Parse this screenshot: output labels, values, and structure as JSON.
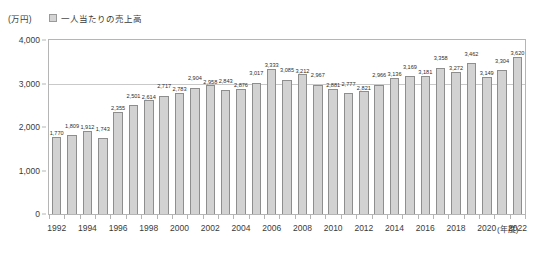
{
  "unit_label": "(万円)",
  "legend": {
    "label": "一人当たりの売上高",
    "swatch_color": "#d2d2d2",
    "swatch_border": "#8e8e8e",
    "position": "top-left"
  },
  "x_axis_caption": "(年度)",
  "colors": {
    "bar_fill": "#d2d2d2",
    "bar_border": "#8e8e8e",
    "frame": "#b5b5b5",
    "grid": "#c9c9c9",
    "text": "#333333"
  },
  "chart_data": {
    "type": "bar",
    "title": "",
    "subtitle": "",
    "xlabel": "(年度)",
    "ylabel": "(万円)",
    "ylim": [
      0,
      4000
    ],
    "y_ticks": [
      "0",
      "1,000",
      "2,000",
      "3,000",
      "4,000"
    ],
    "y_tick_values": [
      0,
      1000,
      2000,
      3000,
      4000
    ],
    "grid": "horizontal-at-3000",
    "legend": [
      "一人当たりの売上高"
    ],
    "x_tick_label_interval": 2,
    "categories": [
      "1992",
      "1993",
      "1994",
      "1995",
      "1996",
      "1997",
      "1998",
      "1999",
      "2000",
      "2001",
      "2002",
      "2003",
      "2004",
      "2005",
      "2006",
      "2007",
      "2008",
      "2009",
      "2010",
      "2011",
      "2012",
      "2013",
      "2014",
      "2015",
      "2016",
      "2017",
      "2018",
      "2019",
      "2020",
      "2021",
      "2022"
    ],
    "values": [
      1770,
      1809,
      1912,
      1743,
      2355,
      2501,
      2614,
      2717,
      2783,
      2904,
      2958,
      2843,
      2876,
      3017,
      3333,
      3085,
      3212,
      2967,
      2881,
      2777,
      2821,
      2966,
      3136,
      3169,
      3181,
      3358,
      3272,
      3462,
      3149,
      3304,
      3620
    ],
    "data_labels": [
      "1,770",
      "1,809",
      "1,912",
      "1,743",
      "2,355",
      "2,501",
      "2,614",
      "2,717",
      "2,783",
      "2,904",
      "2,958",
      "2,843",
      "2,876",
      "3,017",
      "3,333",
      "3,085",
      "3,212",
      "2,967",
      "2,881",
      "2,777",
      "2,821",
      "2,966",
      "3,136",
      "3,169",
      "3,181",
      "3,358",
      "3,272",
      "3,462",
      "3,149",
      "3,304",
      "3,620"
    ],
    "series": [
      {
        "name": "一人当たりの売上高",
        "values": [
          1770,
          1809,
          1912,
          1743,
          2355,
          2501,
          2614,
          2717,
          2783,
          2904,
          2958,
          2843,
          2876,
          3017,
          3333,
          3085,
          3212,
          2967,
          2881,
          2777,
          2821,
          2966,
          3136,
          3169,
          3181,
          3358,
          3272,
          3462,
          3149,
          3304,
          3620
        ]
      }
    ]
  }
}
